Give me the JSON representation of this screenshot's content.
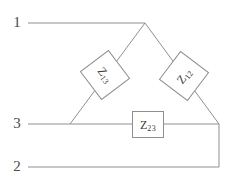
{
  "diagram": {
    "type": "three-terminal delta impedance network",
    "line_color": "#8f8f8f",
    "box_fill": "#ffffff",
    "box_border": "#8f8f8f",
    "text_color": "#3c3c3c",
    "background": "#ffffff"
  },
  "terminals": [
    {
      "id": "1",
      "label": "1",
      "x": 15,
      "y": 23,
      "lead_from_x": 28,
      "lead_to_x": 145
    },
    {
      "id": "3",
      "label": "3",
      "x": 15,
      "y": 124,
      "lead_from_x": 28,
      "lead_to_x": 219
    },
    {
      "id": "2",
      "label": "2",
      "x": 15,
      "y": 167,
      "lead_from_x": 28,
      "lead_to_x": 219
    }
  ],
  "vertices": {
    "apex": {
      "x": 145,
      "y": 23
    },
    "left": {
      "x": 70,
      "y": 124
    },
    "right": {
      "x": 219,
      "y": 124
    },
    "bottom_right": {
      "x": 219,
      "y": 167
    }
  },
  "impedances": [
    {
      "id": "Z13",
      "symbol": "Z",
      "subscript": "13",
      "label": "Z13",
      "between": [
        "1",
        "3"
      ],
      "rotation_deg": 53,
      "center_x": 105,
      "center_y": 75
    },
    {
      "id": "Z12",
      "symbol": "Z",
      "subscript": "12",
      "label": "Z12",
      "between": [
        "1",
        "2"
      ],
      "rotation_deg": -53,
      "center_x": 184,
      "center_y": 76
    },
    {
      "id": "Z23",
      "symbol": "Z",
      "subscript": "23",
      "label": "Z23",
      "between": [
        "2",
        "3"
      ],
      "rotation_deg": 0,
      "center_x": 148,
      "center_y": 124
    }
  ]
}
